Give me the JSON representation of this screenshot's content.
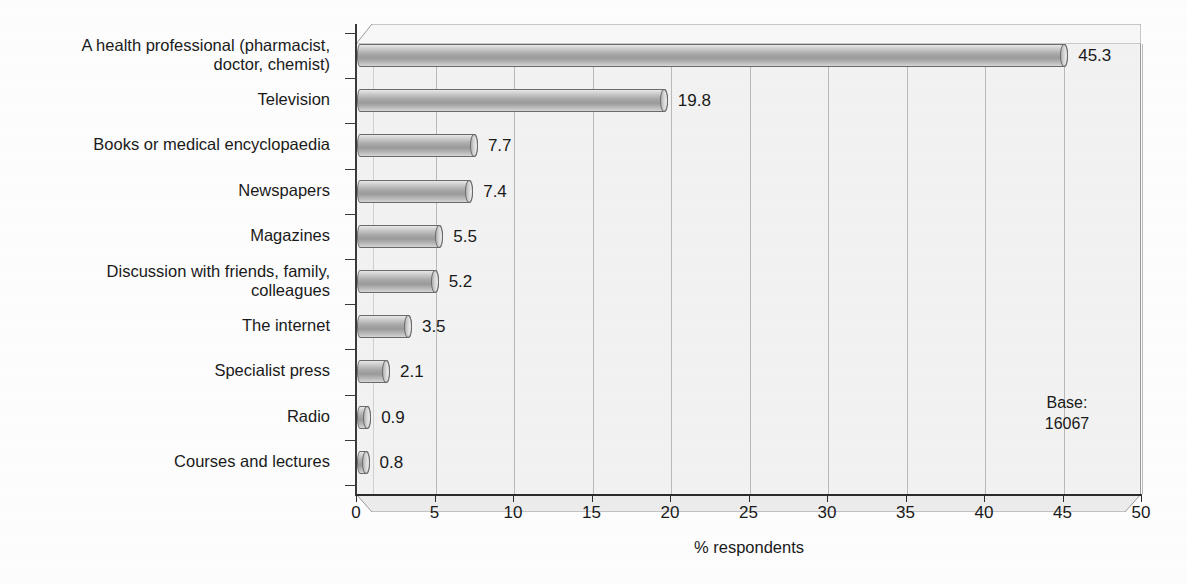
{
  "chart_data": {
    "type": "bar",
    "orientation": "horizontal",
    "title": "",
    "xlabel": "% respondents",
    "ylabel": "",
    "xlim": [
      0,
      50
    ],
    "xticks": [
      "0",
      "5",
      "10",
      "15",
      "20",
      "25",
      "30",
      "35",
      "40",
      "45",
      "50"
    ],
    "grid": true,
    "legend": false,
    "categories": [
      "A health professional (pharmacist, doctor, chemist)",
      "Television",
      "Books or medical encyclopaedia",
      "Newspapers",
      "Magazines",
      "Discussion with friends, family, colleagues",
      "The internet",
      "Specialist press",
      "Radio",
      "Courses and lectures"
    ],
    "values": [
      45.3,
      19.8,
      7.7,
      7.4,
      5.5,
      5.2,
      3.5,
      2.1,
      0.9,
      0.8
    ],
    "value_labels": [
      "45.3",
      "19.8",
      "7.7",
      "7.4",
      "5.5",
      "5.2",
      "3.5",
      "2.1",
      "0.9",
      "0.8"
    ],
    "annotations": [
      {
        "name": "base-note",
        "lines": [
          "Base:",
          "16067"
        ]
      }
    ]
  },
  "category_label_lines": [
    [
      "A health professional (pharmacist,",
      "doctor, chemist)"
    ],
    [
      "Television"
    ],
    [
      "Books or medical encyclopaedia"
    ],
    [
      "Newspapers"
    ],
    [
      "Magazines"
    ],
    [
      "Discussion with friends, family,",
      "colleagues"
    ],
    [
      "The internet"
    ],
    [
      "Specialist press"
    ],
    [
      "Radio"
    ],
    [
      "Courses and lectures"
    ]
  ],
  "base_note": {
    "label": "Base:",
    "value": "16067"
  },
  "axis": {
    "x_title": "% respondents"
  },
  "bleed_through": {
    "title": "ranslation of Nutrition",
    "sub1": "Kim Smith",
    "sub2": "Food Science and Research",
    "sub3": "2004"
  },
  "colors": {
    "plot_background": "#f2f2f2",
    "bar_fill": "#a9a9a9",
    "bar_outline": "#6b6b6b",
    "gridline": "#b9b9b9",
    "axis": "#2b2b2b",
    "text": "#1a1a1a",
    "page": "#fdfdfd"
  }
}
